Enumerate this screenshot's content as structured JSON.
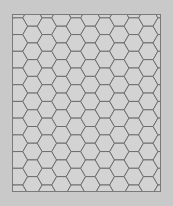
{
  "board": {
    "label": "hex-grid",
    "orientation": "flat-top",
    "columns": 11,
    "rows": 12,
    "colors": {
      "page_background": "#c9c9c9",
      "board_background": "#ffffff",
      "hex_fill": "#d3d3d3",
      "hex_stroke": "#6e6e6e",
      "frame": "#7a7a7a"
    }
  }
}
